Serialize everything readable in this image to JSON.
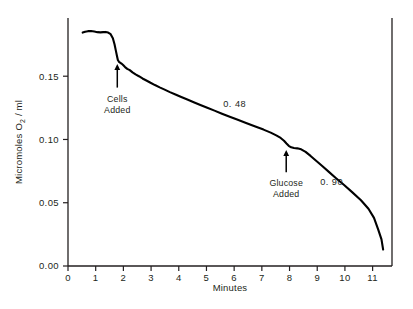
{
  "chart_data": {
    "type": "line",
    "title": "",
    "subtitle": "",
    "xlabel": "Minutes",
    "ylabel": "Micromoles O2 / ml",
    "ylabel_prefix": "Micromoles O",
    "ylabel_subscript": "2",
    "ylabel_suffix": " / ml",
    "xlim": [
      0,
      11.7
    ],
    "ylim": [
      0.0,
      0.196
    ],
    "grid": false,
    "legend": null,
    "xticks": [
      0,
      1,
      2,
      3,
      4,
      5,
      6,
      7,
      8,
      9,
      10,
      11
    ],
    "xtick_labels": [
      "0",
      "1",
      "2",
      "3",
      "4",
      "5",
      "6",
      "7",
      "8",
      "9",
      "10",
      "11"
    ],
    "yticks": [
      0.0,
      0.05,
      0.1,
      0.15
    ],
    "ytick_labels": [
      "0.00",
      "0.05",
      "0.10",
      "0.15"
    ],
    "line_color": "#000000",
    "line_width": 2.1,
    "series": [
      {
        "name": "Oxygen consumption trace",
        "x": [
          0.53,
          0.62,
          0.72,
          0.83,
          0.95,
          1.06,
          1.17,
          1.27,
          1.36,
          1.45,
          1.54,
          1.62,
          1.68,
          1.73,
          1.77,
          1.8,
          1.84,
          1.88,
          1.93,
          1.99,
          2.06,
          2.14,
          2.23,
          2.33,
          2.44,
          2.56,
          2.69,
          2.83,
          2.98,
          3.14,
          3.31,
          3.49,
          3.68,
          3.88,
          4.09,
          4.31,
          4.54,
          4.78,
          5.03,
          5.29,
          5.56,
          5.84,
          6.13,
          6.43,
          6.74,
          7.06,
          7.32,
          7.52,
          7.68,
          7.8,
          7.89,
          7.97,
          8.06,
          8.16,
          8.28,
          8.42,
          8.58,
          8.76,
          8.96,
          9.18,
          9.42,
          9.68,
          9.96,
          10.26,
          10.58,
          10.85,
          11.05,
          11.2,
          11.32
        ],
        "y": [
          0.1845,
          0.1852,
          0.1856,
          0.1857,
          0.1853,
          0.1848,
          0.1846,
          0.1848,
          0.185,
          0.1845,
          0.1832,
          0.18,
          0.1752,
          0.17,
          0.1658,
          0.1628,
          0.1614,
          0.1608,
          0.16,
          0.1588,
          0.1572,
          0.1558,
          0.1548,
          0.153,
          0.1514,
          0.15,
          0.1482,
          0.1466,
          0.1448,
          0.143,
          0.1412,
          0.1394,
          0.1374,
          0.1356,
          0.1336,
          0.1316,
          0.1294,
          0.1272,
          0.125,
          0.1228,
          0.1204,
          0.118,
          0.1156,
          0.113,
          0.1104,
          0.1078,
          0.1054,
          0.1032,
          0.1012,
          0.099,
          0.0968,
          0.095,
          0.0938,
          0.0932,
          0.093,
          0.0922,
          0.0902,
          0.087,
          0.0832,
          0.079,
          0.0744,
          0.0694,
          0.0642,
          0.0584,
          0.052,
          0.0452,
          0.038,
          0.029,
          0.021
        ],
        "y_tail_x": [
          11.32,
          11.38
        ],
        "y_tail_y": [
          0.021,
          0.013
        ]
      }
    ],
    "annotations": [
      {
        "id": "cells-added",
        "label_line1": "Cells",
        "label_line2": "Added",
        "arrow_x": 1.78,
        "arrow_tip_y": 0.16,
        "arrow_tail_y": 0.141,
        "text_x": 1.78,
        "text_y": 0.13
      },
      {
        "id": "glucose-added",
        "label_line1": "Glucose",
        "label_line2": "Added",
        "arrow_x": 7.88,
        "arrow_tip_y": 0.092,
        "arrow_tail_y": 0.074,
        "text_x": 7.88,
        "text_y": 0.063
      }
    ],
    "slope_labels": [
      {
        "id": "slope-upper",
        "text": "0. 48",
        "value": 0.48,
        "x": 6.02,
        "y": 0.1255
      },
      {
        "id": "slope-lower",
        "text": "0. 90",
        "value": 0.9,
        "x": 9.52,
        "y": 0.064
      }
    ]
  }
}
